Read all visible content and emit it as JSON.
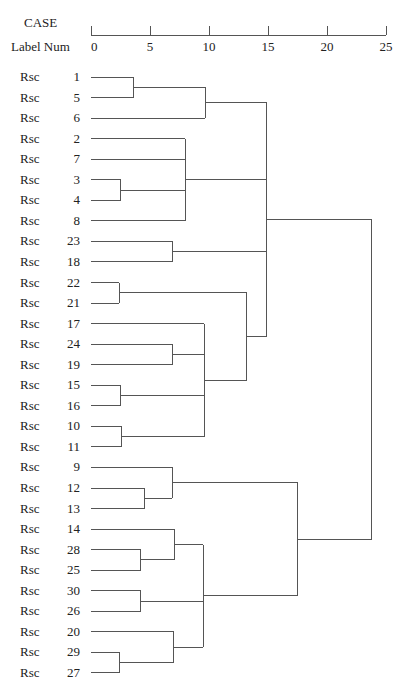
{
  "header": {
    "case_label": "CASE",
    "label_num_label": "Label Num"
  },
  "chart_data": {
    "type": "dendrogram",
    "title": "",
    "xlabel": "Rescaled Distance Cluster Combine",
    "axis": {
      "min": 0,
      "max": 25,
      "ticks": [
        0,
        5,
        10,
        15,
        20,
        25
      ]
    },
    "leaf_prefix": "Rsc",
    "leaves": [
      1,
      5,
      6,
      2,
      7,
      3,
      4,
      8,
      23,
      18,
      22,
      21,
      17,
      24,
      19,
      15,
      16,
      10,
      11,
      9,
      12,
      13,
      14,
      28,
      25,
      30,
      26,
      20,
      29,
      27
    ],
    "merges": [
      {
        "id": "A",
        "children": [
          "1",
          "5"
        ],
        "distance": 3.6
      },
      {
        "id": "B",
        "children": [
          "A",
          "6"
        ],
        "distance": 9.7
      },
      {
        "id": "C",
        "children": [
          "3",
          "4"
        ],
        "distance": 2.5
      },
      {
        "id": "D",
        "children": [
          "2",
          "7",
          "C",
          "8"
        ],
        "distance": 8.0
      },
      {
        "id": "E",
        "children": [
          "23",
          "18"
        ],
        "distance": 6.9
      },
      {
        "id": "F",
        "children": [
          "22",
          "21"
        ],
        "distance": 2.4
      },
      {
        "id": "G",
        "children": [
          "24",
          "19"
        ],
        "distance": 6.9
      },
      {
        "id": "H",
        "children": [
          "15",
          "16"
        ],
        "distance": 2.5
      },
      {
        "id": "I",
        "children": [
          "10",
          "11"
        ],
        "distance": 2.6
      },
      {
        "id": "J",
        "children": [
          "17",
          "G",
          "H",
          "I"
        ],
        "distance": 9.6
      },
      {
        "id": "K",
        "children": [
          "F",
          "J"
        ],
        "distance": 13.2
      },
      {
        "id": "L",
        "children": [
          "B",
          "D",
          "E",
          "K"
        ],
        "distance": 14.9
      },
      {
        "id": "M",
        "children": [
          "12",
          "13"
        ],
        "distance": 4.5
      },
      {
        "id": "N",
        "children": [
          "9",
          "M"
        ],
        "distance": 6.9
      },
      {
        "id": "O",
        "children": [
          "28",
          "25"
        ],
        "distance": 4.2
      },
      {
        "id": "P",
        "children": [
          "14",
          "O"
        ],
        "distance": 7.1
      },
      {
        "id": "Q",
        "children": [
          "30",
          "26"
        ],
        "distance": 4.2
      },
      {
        "id": "R",
        "children": [
          "29",
          "27"
        ],
        "distance": 2.4
      },
      {
        "id": "S",
        "children": [
          "20",
          "R"
        ],
        "distance": 7.0
      },
      {
        "id": "T",
        "children": [
          "P",
          "Q",
          "S"
        ],
        "distance": 9.5
      },
      {
        "id": "U",
        "children": [
          "N",
          "T"
        ],
        "distance": 17.5
      },
      {
        "id": "V",
        "children": [
          "L",
          "U"
        ],
        "distance": 23.8
      }
    ]
  }
}
